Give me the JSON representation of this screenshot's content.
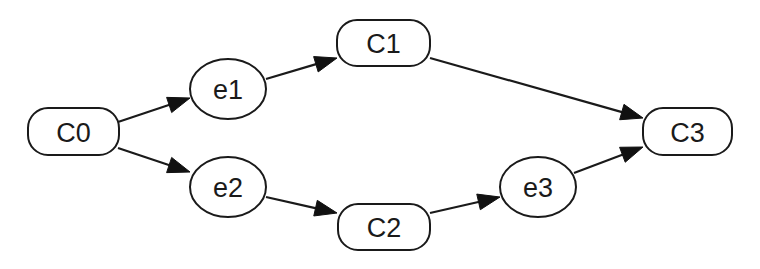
{
  "diagram": {
    "type": "directed-graph",
    "canvas": {
      "width": 760,
      "height": 269,
      "background": "#ffffff"
    },
    "colors": {
      "stroke": "#1a1a1a",
      "arrowhead": "#111111",
      "text": "#1a1a1a",
      "fill": "#ffffff"
    },
    "nodes": [
      {
        "id": "C0",
        "label": "C0",
        "shape": "rounded-rect",
        "x": 28,
        "y": 108,
        "w": 91,
        "h": 47
      },
      {
        "id": "e1",
        "label": "e1",
        "shape": "ellipse",
        "cx": 228,
        "cy": 89,
        "rx": 38,
        "ry": 30
      },
      {
        "id": "e2",
        "label": "e2",
        "shape": "ellipse",
        "cx": 228,
        "cy": 187,
        "rx": 38,
        "ry": 30
      },
      {
        "id": "C1",
        "label": "C1",
        "shape": "rounded-rect",
        "x": 337,
        "y": 20,
        "w": 93,
        "h": 46
      },
      {
        "id": "C2",
        "label": "C2",
        "shape": "rounded-rect",
        "x": 338,
        "y": 204,
        "w": 92,
        "h": 46
      },
      {
        "id": "e3",
        "label": "e3",
        "shape": "ellipse",
        "cx": 538,
        "cy": 187,
        "rx": 38,
        "ry": 30
      },
      {
        "id": "C3",
        "label": "C3",
        "shape": "rounded-rect",
        "x": 643,
        "y": 108,
        "w": 89,
        "h": 47
      }
    ],
    "edges": [
      {
        "from": "C0",
        "to": "e1",
        "x1": 118,
        "y1": 122,
        "x2": 190,
        "y2": 98
      },
      {
        "from": "C0",
        "to": "e2",
        "x1": 118,
        "y1": 148,
        "x2": 190,
        "y2": 172
      },
      {
        "from": "e1",
        "to": "C1",
        "x1": 266,
        "y1": 79,
        "x2": 337,
        "y2": 58
      },
      {
        "from": "e2",
        "to": "C2",
        "x1": 266,
        "y1": 197,
        "x2": 337,
        "y2": 213
      },
      {
        "from": "C1",
        "to": "C3",
        "x1": 430,
        "y1": 58,
        "x2": 643,
        "y2": 118
      },
      {
        "from": "C2",
        "to": "e3",
        "x1": 430,
        "y1": 213,
        "x2": 500,
        "y2": 197
      },
      {
        "from": "e3",
        "to": "C3",
        "x1": 574,
        "y1": 173,
        "x2": 643,
        "y2": 147
      }
    ]
  }
}
